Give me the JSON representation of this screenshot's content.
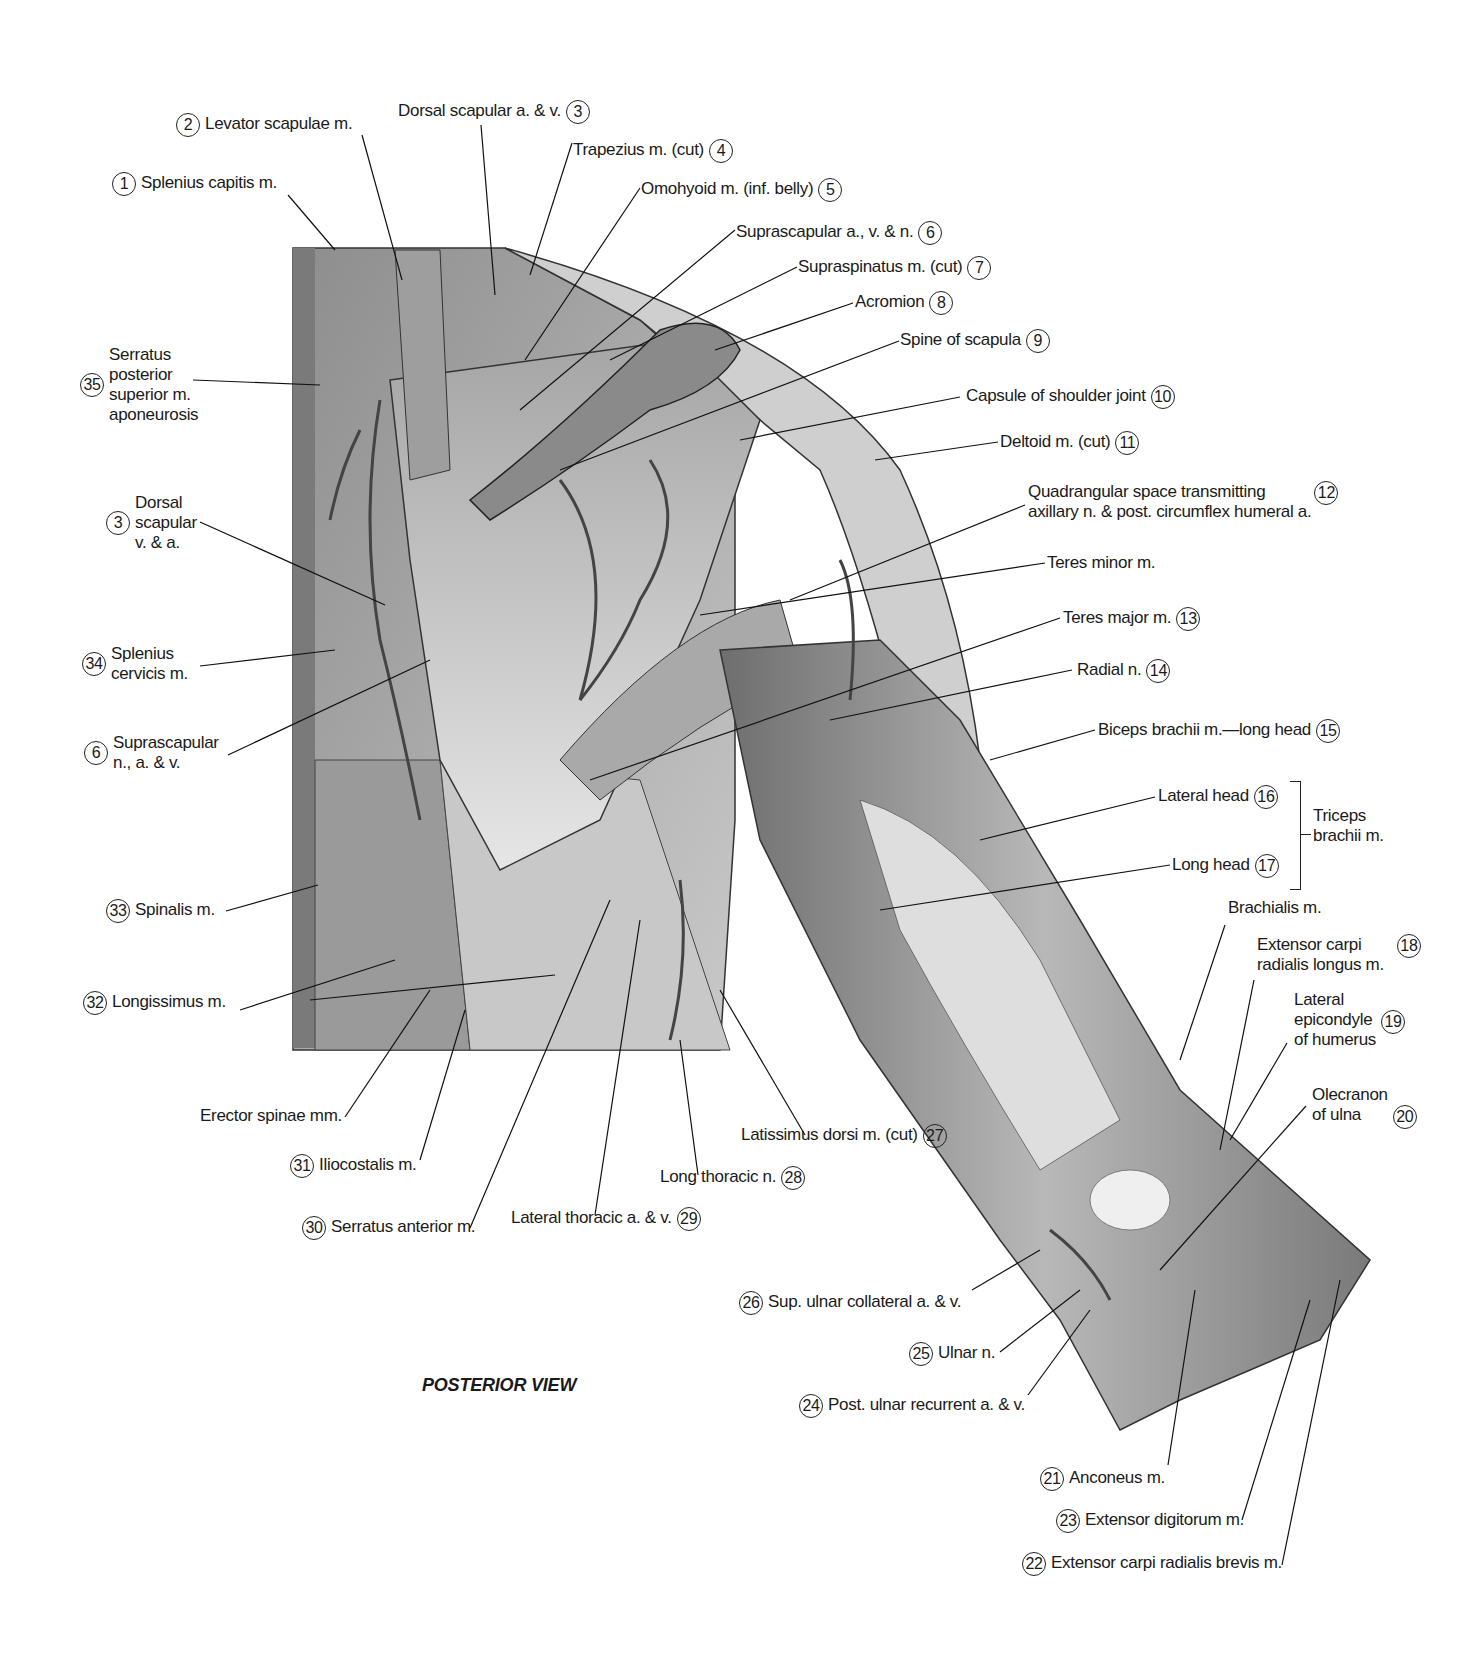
{
  "figure": {
    "view_title": "POSTERIOR VIEW",
    "group_labels": [
      {
        "text": "Triceps\nbrachii m.",
        "groups": [
          16,
          17
        ]
      }
    ]
  },
  "labels": [
    {
      "num": "1",
      "text": "Splenius capitis m."
    },
    {
      "num": "2",
      "text": "Levator scapulae m."
    },
    {
      "num": "3",
      "text": "Dorsal scapular a. & v."
    },
    {
      "num": "4",
      "text": "Trapezius m. (cut)"
    },
    {
      "num": "5",
      "text": "Omohyoid m. (inf. belly)"
    },
    {
      "num": "6",
      "text": "Suprascapular a., v. & n."
    },
    {
      "num": "7",
      "text": "Supraspinatus m. (cut)"
    },
    {
      "num": "8",
      "text": "Acromion"
    },
    {
      "num": "9",
      "text": "Spine of scapula"
    },
    {
      "num": "10",
      "text": "Capsule of shoulder joint"
    },
    {
      "num": "11",
      "text": "Deltoid m. (cut)"
    },
    {
      "num": "12",
      "text": "Quadrangular space transmitting\naxillary n. & post. circumflex humeral a."
    },
    {
      "num": "",
      "text": "Teres minor m."
    },
    {
      "num": "13",
      "text": "Teres major m."
    },
    {
      "num": "14",
      "text": "Radial n."
    },
    {
      "num": "15",
      "text": "Biceps brachii m.—long head"
    },
    {
      "num": "16",
      "text": "Lateral head"
    },
    {
      "num": "17",
      "text": "Long head"
    },
    {
      "num": "",
      "text": "Brachialis m."
    },
    {
      "num": "18",
      "text": "Extensor carpi\nradialis longus m."
    },
    {
      "num": "19",
      "text": "Lateral\nepicondyle\nof humerus"
    },
    {
      "num": "20",
      "text": "Olecranon\nof ulna"
    },
    {
      "num": "21",
      "text": "Anconeus m."
    },
    {
      "num": "22",
      "text": "Extensor carpi radialis brevis m."
    },
    {
      "num": "23",
      "text": "Extensor digitorum m."
    },
    {
      "num": "24",
      "text": "Post. ulnar recurrent a. & v."
    },
    {
      "num": "25",
      "text": "Ulnar n."
    },
    {
      "num": "26",
      "text": "Sup. ulnar collateral a. & v."
    },
    {
      "num": "27",
      "text": "Latissimus dorsi m. (cut)"
    },
    {
      "num": "28",
      "text": "Long thoracic n."
    },
    {
      "num": "29",
      "text": "Lateral thoracic a. & v."
    },
    {
      "num": "30",
      "text": "Serratus anterior m."
    },
    {
      "num": "31",
      "text": "Iliocostalis m."
    },
    {
      "num": "",
      "text": "Erector spinae mm."
    },
    {
      "num": "32",
      "text": "Longissimus m."
    },
    {
      "num": "33",
      "text": "Spinalis m."
    },
    {
      "num": "6",
      "text": "Suprascapular\nn., a. & v."
    },
    {
      "num": "34",
      "text": "Splenius\ncervicis m."
    },
    {
      "num": "3",
      "text": "Dorsal\nscapular\nv. & a."
    },
    {
      "num": "35",
      "text": "Serratus\nposterior\nsuperior m.\naponeurosis"
    }
  ]
}
